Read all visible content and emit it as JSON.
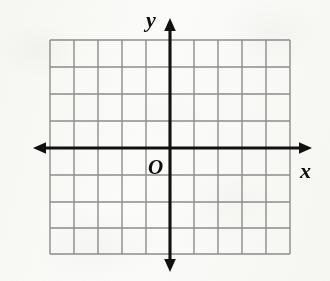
{
  "figure": {
    "kind": "coordinate-plane",
    "width": 330,
    "height": 281,
    "background_color": "#fbfbf9",
    "gridline_color": "#8e8e8e",
    "axis_color": "#111111"
  },
  "labels": {
    "y_axis": "y",
    "x_axis": "x",
    "origin": "O"
  },
  "chart_data": {
    "type": "scatter",
    "title": "",
    "subtitle": "",
    "xlabel": "x",
    "ylabel": "y",
    "origin_label": "O",
    "grid": true,
    "legend": null,
    "legend_position": "none",
    "annotations": [],
    "series": [],
    "x": [],
    "values": [],
    "xlim": [
      -5,
      5
    ],
    "ylim": [
      -4,
      4
    ],
    "xticks": [
      -5,
      -4,
      -3,
      -2,
      -1,
      0,
      1,
      2,
      3,
      4,
      5
    ],
    "yticks": [
      -4,
      -3,
      -2,
      -1,
      0,
      1,
      2,
      3,
      4
    ],
    "xtick_labels": [],
    "ytick_labels": [],
    "grid_cells_x": 10,
    "grid_cells_y": 8,
    "cell_width_px": 24,
    "cell_height_px": 26.8,
    "axis_arrows": [
      "left",
      "right",
      "up",
      "down"
    ]
  },
  "geometry": {
    "grid_vertical_x": [
      50,
      74,
      98,
      122,
      146,
      170,
      194,
      218,
      242,
      266,
      290
    ],
    "grid_horizontal_y": [
      40,
      67,
      94,
      121,
      148,
      175,
      202,
      228,
      254
    ],
    "grid_left": 50,
    "grid_right": 290,
    "grid_top": 40,
    "grid_bottom": 254,
    "x_axis_y": 148,
    "y_axis_x": 170,
    "x_axis_start": 33,
    "x_axis_end": 312,
    "y_axis_start": 18,
    "y_axis_end": 272
  }
}
